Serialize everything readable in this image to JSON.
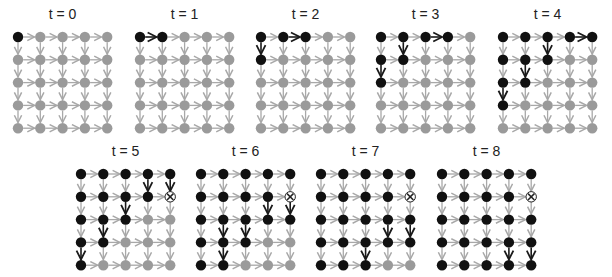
{
  "figure": {
    "grid_size": 5,
    "colors": {
      "visited_node": "#111111",
      "unvisited_node": "#9a9a9a",
      "active_edge": "#1a1a1a",
      "inactive_edge": "#a8a8a8",
      "failed_node_fill": "#ffffff",
      "failed_node_mark": "#222222"
    },
    "panels": [
      {
        "label": "t = 0",
        "x0": 18,
        "y0": 37,
        "visited": [
          [
            0,
            0
          ]
        ],
        "failed": [],
        "active_edges": []
      },
      {
        "label": "t = 1",
        "x0": 140,
        "y0": 37,
        "visited": [
          [
            0,
            0
          ],
          [
            0,
            1
          ]
        ],
        "failed": [],
        "active_edges": [
          [
            [
              0,
              0
            ],
            [
              0,
              1
            ]
          ]
        ]
      },
      {
        "label": "t = 2",
        "x0": 261,
        "y0": 37,
        "visited": [
          [
            0,
            0
          ],
          [
            0,
            1
          ],
          [
            0,
            2
          ],
          [
            1,
            0
          ]
        ],
        "failed": [],
        "active_edges": [
          [
            [
              0,
              1
            ],
            [
              0,
              2
            ]
          ],
          [
            [
              0,
              0
            ],
            [
              1,
              0
            ]
          ]
        ]
      },
      {
        "label": "t = 3",
        "x0": 381,
        "y0": 37,
        "visited": [
          [
            0,
            0
          ],
          [
            0,
            1
          ],
          [
            0,
            2
          ],
          [
            0,
            3
          ],
          [
            1,
            0
          ],
          [
            1,
            1
          ],
          [
            2,
            0
          ]
        ],
        "failed": [],
        "active_edges": [
          [
            [
              0,
              2
            ],
            [
              0,
              3
            ]
          ],
          [
            [
              0,
              1
            ],
            [
              1,
              1
            ]
          ],
          [
            [
              1,
              0
            ],
            [
              2,
              0
            ]
          ]
        ]
      },
      {
        "label": "t = 4",
        "x0": 503,
        "y0": 37,
        "visited": [
          [
            0,
            0
          ],
          [
            0,
            1
          ],
          [
            0,
            2
          ],
          [
            0,
            3
          ],
          [
            0,
            4
          ],
          [
            1,
            0
          ],
          [
            1,
            1
          ],
          [
            1,
            2
          ],
          [
            2,
            0
          ],
          [
            2,
            1
          ],
          [
            3,
            0
          ]
        ],
        "failed": [],
        "active_edges": [
          [
            [
              0,
              3
            ],
            [
              0,
              4
            ]
          ],
          [
            [
              0,
              2
            ],
            [
              1,
              2
            ]
          ],
          [
            [
              1,
              1
            ],
            [
              2,
              1
            ]
          ],
          [
            [
              2,
              0
            ],
            [
              3,
              0
            ]
          ]
        ]
      },
      {
        "label": "t = 5",
        "x0": 81,
        "y0": 174,
        "visited": [
          [
            0,
            0
          ],
          [
            0,
            1
          ],
          [
            0,
            2
          ],
          [
            0,
            3
          ],
          [
            0,
            4
          ],
          [
            1,
            0
          ],
          [
            1,
            1
          ],
          [
            1,
            2
          ],
          [
            1,
            3
          ],
          [
            2,
            0
          ],
          [
            2,
            1
          ],
          [
            2,
            2
          ],
          [
            3,
            0
          ],
          [
            3,
            1
          ],
          [
            4,
            0
          ]
        ],
        "failed": [
          [
            1,
            4
          ]
        ],
        "active_edges": [
          [
            [
              0,
              3
            ],
            [
              1,
              3
            ]
          ],
          [
            [
              0,
              4
            ],
            [
              1,
              4
            ]
          ],
          [
            [
              1,
              2
            ],
            [
              2,
              2
            ]
          ],
          [
            [
              2,
              1
            ],
            [
              3,
              1
            ]
          ],
          [
            [
              3,
              0
            ],
            [
              4,
              0
            ]
          ]
        ]
      },
      {
        "label": "t = 6",
        "x0": 201,
        "y0": 174,
        "visited": [
          [
            0,
            0
          ],
          [
            0,
            1
          ],
          [
            0,
            2
          ],
          [
            0,
            3
          ],
          [
            0,
            4
          ],
          [
            1,
            0
          ],
          [
            1,
            1
          ],
          [
            1,
            2
          ],
          [
            1,
            3
          ],
          [
            2,
            0
          ],
          [
            2,
            1
          ],
          [
            2,
            2
          ],
          [
            2,
            3
          ],
          [
            2,
            4
          ],
          [
            3,
            0
          ],
          [
            3,
            1
          ],
          [
            3,
            2
          ],
          [
            4,
            0
          ],
          [
            4,
            1
          ]
        ],
        "failed": [
          [
            1,
            4
          ]
        ],
        "active_edges": [
          [
            [
              1,
              3
            ],
            [
              2,
              3
            ]
          ],
          [
            [
              1,
              4
            ],
            [
              2,
              4
            ]
          ],
          [
            [
              2,
              1
            ],
            [
              3,
              1
            ]
          ],
          [
            [
              2,
              2
            ],
            [
              3,
              2
            ]
          ],
          [
            [
              3,
              1
            ],
            [
              4,
              1
            ]
          ]
        ]
      },
      {
        "label": "t = 7",
        "x0": 321,
        "y0": 174,
        "visited": [
          [
            0,
            0
          ],
          [
            0,
            1
          ],
          [
            0,
            2
          ],
          [
            0,
            3
          ],
          [
            0,
            4
          ],
          [
            1,
            0
          ],
          [
            1,
            1
          ],
          [
            1,
            2
          ],
          [
            1,
            3
          ],
          [
            2,
            0
          ],
          [
            2,
            1
          ],
          [
            2,
            2
          ],
          [
            2,
            3
          ],
          [
            2,
            4
          ],
          [
            3,
            0
          ],
          [
            3,
            1
          ],
          [
            3,
            2
          ],
          [
            3,
            3
          ],
          [
            3,
            4
          ],
          [
            4,
            0
          ],
          [
            4,
            1
          ],
          [
            4,
            2
          ]
        ],
        "failed": [
          [
            1,
            4
          ]
        ],
        "active_edges": [
          [
            [
              2,
              3
            ],
            [
              3,
              3
            ]
          ],
          [
            [
              2,
              4
            ],
            [
              3,
              4
            ]
          ],
          [
            [
              3,
              2
            ],
            [
              4,
              2
            ]
          ]
        ]
      },
      {
        "label": "t = 8",
        "x0": 442,
        "y0": 174,
        "visited": [
          [
            0,
            0
          ],
          [
            0,
            1
          ],
          [
            0,
            2
          ],
          [
            0,
            3
          ],
          [
            0,
            4
          ],
          [
            1,
            0
          ],
          [
            1,
            1
          ],
          [
            1,
            2
          ],
          [
            1,
            3
          ],
          [
            2,
            0
          ],
          [
            2,
            1
          ],
          [
            2,
            2
          ],
          [
            2,
            3
          ],
          [
            2,
            4
          ],
          [
            3,
            0
          ],
          [
            3,
            1
          ],
          [
            3,
            2
          ],
          [
            3,
            3
          ],
          [
            3,
            4
          ],
          [
            4,
            0
          ],
          [
            4,
            1
          ],
          [
            4,
            2
          ],
          [
            4,
            3
          ],
          [
            4,
            4
          ]
        ],
        "failed": [
          [
            1,
            4
          ]
        ],
        "active_edges": [
          [
            [
              3,
              3
            ],
            [
              4,
              3
            ]
          ],
          [
            [
              3,
              4
            ],
            [
              4,
              4
            ]
          ]
        ]
      }
    ],
    "spacing_x": 22.3,
    "spacing_y": 22.8
  }
}
